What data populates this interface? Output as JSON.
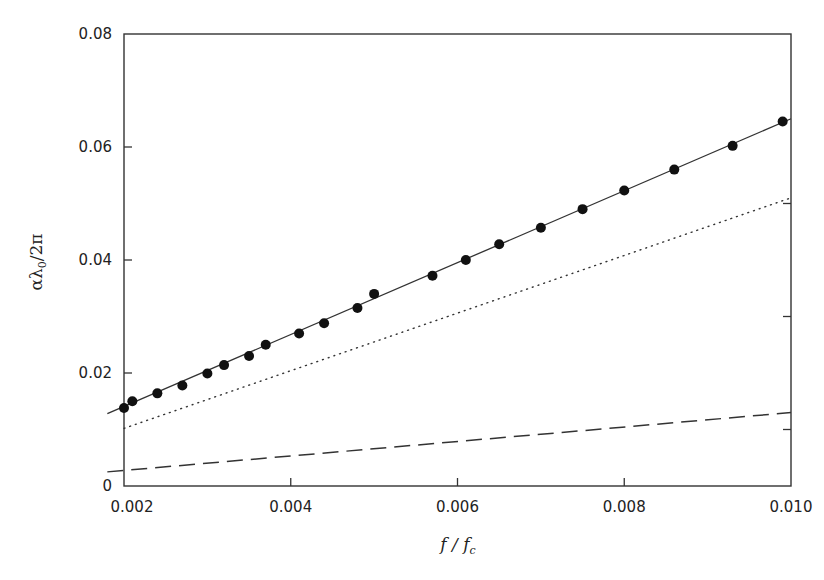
{
  "chart_data": {
    "type": "line",
    "title": "",
    "xlabel": "f/f_c",
    "ylabel": "αλ0/2π",
    "xlim": [
      0.0018,
      0.01
    ],
    "ylim": [
      0,
      0.08
    ],
    "grid": false,
    "legend": null,
    "x_ticks": [
      "0.002",
      "0.004",
      "0.006",
      "0.008",
      "0.010"
    ],
    "y_ticks": [
      "0",
      "0.02",
      "0.04",
      "0.06",
      "0.08"
    ],
    "series": [
      {
        "name": "measured",
        "style": "filled-circle markers",
        "x": [
          0.002,
          0.0021,
          0.0024,
          0.0027,
          0.003,
          0.0032,
          0.0035,
          0.0037,
          0.0041,
          0.0044,
          0.0048,
          0.005,
          0.0057,
          0.0061,
          0.0065,
          0.007,
          0.0075,
          0.008,
          0.0086,
          0.0093,
          0.0099
        ],
        "y": [
          0.0138,
          0.015,
          0.0164,
          0.0178,
          0.0199,
          0.0214,
          0.023,
          0.025,
          0.027,
          0.0288,
          0.0315,
          0.034,
          0.0372,
          0.04,
          0.0428,
          0.0457,
          0.049,
          0.0523,
          0.056,
          0.0602,
          0.0645
        ]
      },
      {
        "name": "total (solid line)",
        "style": "solid",
        "x": [
          0.0018,
          0.01
        ],
        "y": [
          0.0128,
          0.065
        ]
      },
      {
        "name": "component (dotted line)",
        "style": "dotted",
        "x": [
          0.002,
          0.01
        ],
        "y": [
          0.0102,
          0.051
        ]
      },
      {
        "name": "component (dashed line)",
        "style": "dashed",
        "x": [
          0.0018,
          0.01
        ],
        "y": [
          0.0025,
          0.013
        ]
      }
    ]
  },
  "axes": {
    "xlabel_main": "f / f",
    "xlabel_sub": "c",
    "ylabel_main": "αλ",
    "ylabel_sub": "0",
    "ylabel_tail": "/2π"
  }
}
